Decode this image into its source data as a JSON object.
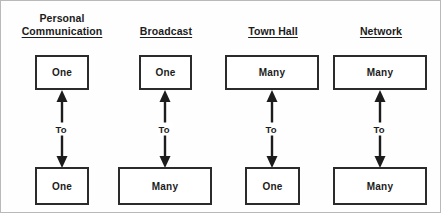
{
  "figure": {
    "title_alt": "",
    "colors": {
      "box_border": "#2b2b2b",
      "arrow": "#1c1c1c",
      "background": "#ffffff",
      "frame": "#b9b9b9"
    }
  },
  "columns": [
    {
      "title_line1": "Personal",
      "title_line2": "Communication",
      "source": "One",
      "relation": "To",
      "target": "One"
    },
    {
      "title_line1": "",
      "title_line2": "Broadcast",
      "source": "One",
      "relation": "To",
      "target": "Many"
    },
    {
      "title_line1": "",
      "title_line2": "Town Hall",
      "source": "Many",
      "relation": "To",
      "target": "One"
    },
    {
      "title_line1": "",
      "title_line2": "Network",
      "source": "Many",
      "relation": "To",
      "target": "Many"
    }
  ]
}
